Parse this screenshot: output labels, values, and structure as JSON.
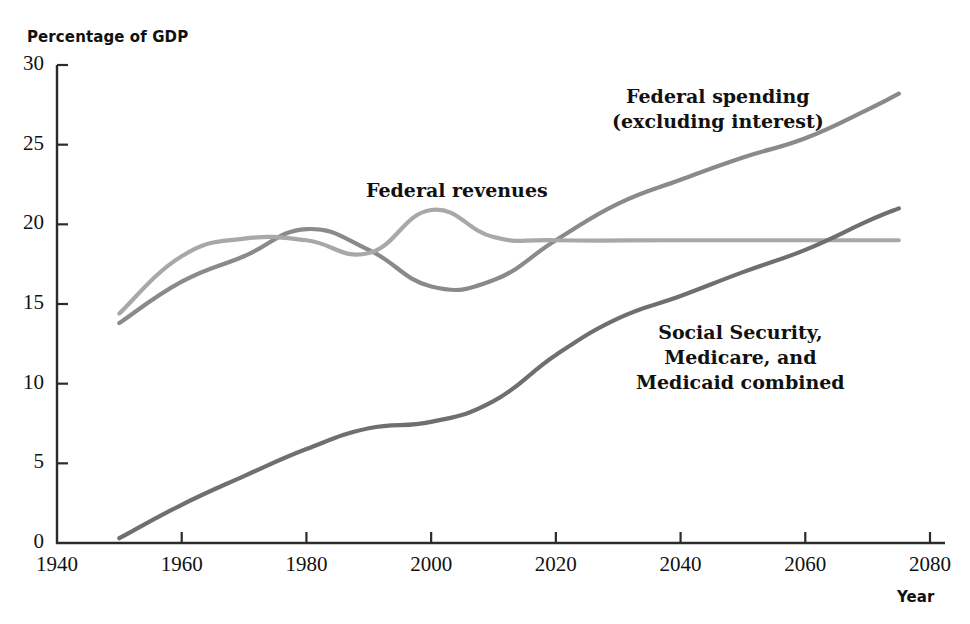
{
  "chart_data": {
    "type": "line",
    "title": "",
    "xlabel": "Year",
    "ylabel": "Percentage of GDP",
    "xlim": [
      1940,
      2080
    ],
    "ylim": [
      0,
      30
    ],
    "xticks": [
      1940,
      1960,
      1980,
      2000,
      2020,
      2040,
      2060,
      2080
    ],
    "yticks": [
      0,
      5,
      10,
      15,
      20,
      25,
      30
    ],
    "grid": false,
    "legend_position": "inline-annotations",
    "series": [
      {
        "name": "Federal spending (excluding interest)",
        "color": "#8a8a8a",
        "x": [
          1950,
          1960,
          1970,
          1980,
          1990,
          2000,
          2010,
          2020,
          2030,
          2040,
          2050,
          2060,
          2070,
          2075
        ],
        "values": [
          13.8,
          16.4,
          18.0,
          19.7,
          18.4,
          16.1,
          16.5,
          19.0,
          21.3,
          22.8,
          24.2,
          25.4,
          27.2,
          28.2
        ]
      },
      {
        "name": "Federal revenues",
        "color": "#a8a8a8",
        "x": [
          1950,
          1960,
          1970,
          1980,
          1990,
          2000,
          2010,
          2020,
          2040,
          2060,
          2075
        ],
        "values": [
          14.4,
          18.0,
          19.1,
          19.0,
          18.2,
          20.9,
          19.2,
          19.0,
          19.0,
          19.0,
          19.0
        ]
      },
      {
        "name": "Social Security, Medicare, and Medicaid combined",
        "color": "#6f6f6f",
        "x": [
          1950,
          1960,
          1970,
          1980,
          1990,
          2000,
          2010,
          2020,
          2030,
          2040,
          2050,
          2060,
          2070,
          2075
        ],
        "values": [
          0.3,
          2.4,
          4.2,
          5.9,
          7.2,
          7.6,
          8.9,
          11.8,
          14.1,
          15.5,
          17.0,
          18.4,
          20.2,
          21.0
        ]
      }
    ],
    "annotations": [
      {
        "id": "spending",
        "lines": [
          "Federal spending",
          "(excluding interest)"
        ]
      },
      {
        "id": "revenues",
        "lines": [
          "Federal revenues"
        ]
      },
      {
        "id": "entitlements",
        "lines": [
          "Social Security,",
          "Medicare, and",
          "Medicaid combined"
        ]
      }
    ]
  },
  "axes": {
    "y_axis_title": "Percentage of GDP",
    "x_axis_title": "Year",
    "y_tick_labels": [
      "30",
      "25",
      "20",
      "15",
      "10",
      "5",
      "0"
    ],
    "x_tick_labels": [
      "1940",
      "1960",
      "1980",
      "2000",
      "2020",
      "2040",
      "2060",
      "2080"
    ]
  },
  "annotations": {
    "spending_line1": "Federal spending",
    "spending_line2": "(excluding interest)",
    "revenues_line1": "Federal revenues",
    "entitlements_line1": "Social Security,",
    "entitlements_line2": "Medicare, and",
    "entitlements_line3": "Medicaid combined"
  },
  "colors": {
    "spending": "#8a8a8a",
    "revenues": "#a8a8a8",
    "entitlements": "#6f6f6f",
    "axis": "#2b2b2b",
    "text": "#111111"
  }
}
